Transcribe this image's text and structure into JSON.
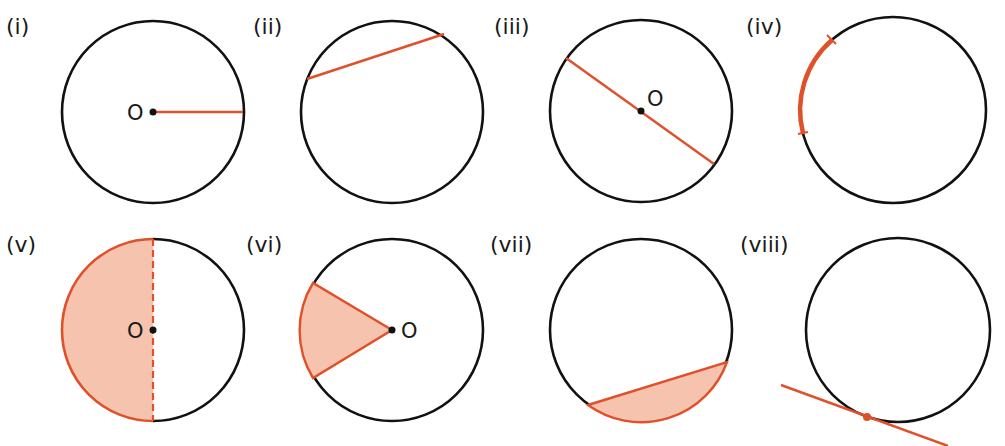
{
  "figure": {
    "colors": {
      "outline": "#111111",
      "highlight": "#e0502a",
      "shade": "#f6c4ae"
    },
    "centre_label": "O",
    "panels": [
      {
        "id": "i",
        "label": "(i)",
        "depicts": "radius"
      },
      {
        "id": "ii",
        "label": "(ii)",
        "depicts": "chord"
      },
      {
        "id": "iii",
        "label": "(iii)",
        "depicts": "diameter"
      },
      {
        "id": "iv",
        "label": "(iv)",
        "depicts": "arc"
      },
      {
        "id": "v",
        "label": "(v)",
        "depicts": "semicircle"
      },
      {
        "id": "vi",
        "label": "(vi)",
        "depicts": "sector"
      },
      {
        "id": "vii",
        "label": "(vii)",
        "depicts": "segment"
      },
      {
        "id": "viii",
        "label": "(viii)",
        "depicts": "tangent"
      }
    ]
  }
}
